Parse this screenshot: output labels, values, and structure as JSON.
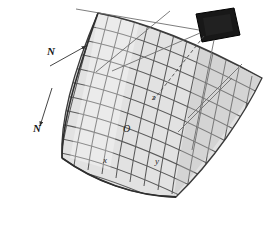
{
  "figure": {
    "background_color": "#ffffff"
  },
  "reflector": {
    "name": "curved-mesh-reflector",
    "grid_rows": 13,
    "grid_cols": 15,
    "cell_fill": "#d8d8d8",
    "cell_fill_light": "#ececec",
    "grid_line_color": "#555555",
    "outline_color": "#3a3a3a"
  },
  "feed": {
    "name": "feed-element",
    "fill": "#181818",
    "stroke": "#000000"
  },
  "rays": {
    "solid_color": "#6e6e6e",
    "dashed_color": "#4a4a4a"
  },
  "labels": {
    "n_rows": "N",
    "n_cols": "N",
    "origin": "O",
    "axis_x": "x",
    "axis_y": "y",
    "axis_z": "z"
  }
}
